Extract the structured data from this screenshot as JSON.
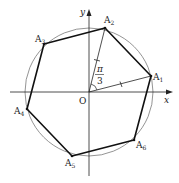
{
  "diagram": {
    "type": "geometry",
    "axes": {
      "x_label": "x",
      "y_label": "y",
      "origin_label": "O"
    },
    "angle_label": {
      "numerator": "π",
      "denominator": "3"
    },
    "vertices": [
      {
        "name": "A",
        "sub": "1"
      },
      {
        "name": "A",
        "sub": "2"
      },
      {
        "name": "A",
        "sub": "3"
      },
      {
        "name": "A",
        "sub": "4"
      },
      {
        "name": "A",
        "sub": "5"
      },
      {
        "name": "A",
        "sub": "6"
      }
    ],
    "colors": {
      "stroke": "#222222",
      "circle": "#555555",
      "background": "#ffffff"
    }
  }
}
